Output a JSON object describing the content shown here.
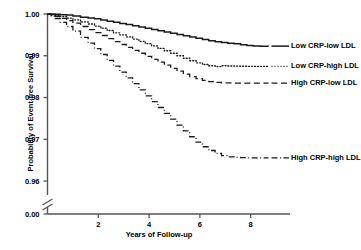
{
  "chart_data": {
    "type": "line",
    "title": "",
    "subtitle": "",
    "xlabel": "Years of Follow-up",
    "ylabel": "Probability of Event-free Survival",
    "xlim": [
      0,
      8.8
    ],
    "ylim": [
      0.96,
      1.0
    ],
    "y_axis_break": true,
    "y_break_label": "0.00",
    "grid": false,
    "legend_position": "right-inline",
    "xticks": [
      2,
      4,
      6,
      8
    ],
    "xtick_labels": [
      "2",
      "4",
      "6",
      "8"
    ],
    "yticks": [
      1.0,
      0.99,
      0.98,
      0.97,
      0.96
    ],
    "ytick_labels": [
      "1.00",
      "0.99",
      "0.98",
      "0.97",
      "0.96"
    ],
    "series": [
      {
        "name": "Low CRP-low LDL",
        "style": "solid",
        "label_x": 8.9,
        "label_y": 0.9923,
        "x": [
          0,
          0.15,
          0.3,
          0.5,
          0.75,
          1.0,
          1.3,
          1.6,
          1.85,
          2.1,
          2.35,
          2.6,
          2.85,
          3.1,
          3.35,
          3.6,
          3.85,
          4.1,
          4.35,
          4.6,
          4.85,
          5.1,
          5.35,
          5.6,
          5.85,
          6.1,
          6.35,
          6.6,
          6.85,
          7.1,
          7.35,
          7.6,
          7.85,
          8.1,
          8.4,
          8.7
        ],
        "y": [
          1.0,
          1.0,
          0.99995,
          0.99985,
          0.99975,
          0.99955,
          0.99925,
          0.99905,
          0.99885,
          0.99855,
          0.99825,
          0.998,
          0.99775,
          0.9975,
          0.9972,
          0.9969,
          0.9966,
          0.9963,
          0.996,
          0.9957,
          0.9954,
          0.9951,
          0.9948,
          0.9945,
          0.9942,
          0.9939,
          0.9936,
          0.99335,
          0.99315,
          0.993,
          0.99285,
          0.99265,
          0.99245,
          0.99235,
          0.9923,
          0.99228
        ]
      },
      {
        "name": "Low CRP-high LDL",
        "style": "dotted",
        "label_x": 8.9,
        "label_y": 0.98745,
        "x": [
          0,
          0.15,
          0.3,
          0.5,
          0.75,
          1.0,
          1.3,
          1.6,
          1.85,
          2.1,
          2.35,
          2.6,
          2.85,
          3.1,
          3.35,
          3.6,
          3.85,
          4.1,
          4.35,
          4.6,
          4.85,
          5.1,
          5.35,
          5.6,
          5.85,
          6.1,
          6.35,
          6.6,
          6.85,
          7.1,
          7.35,
          7.6,
          7.85,
          8.1,
          8.4,
          8.7
        ],
        "y": [
          1.0,
          0.99985,
          0.99965,
          0.99935,
          0.999,
          0.9986,
          0.9981,
          0.9976,
          0.9971,
          0.9966,
          0.99605,
          0.9955,
          0.995,
          0.9945,
          0.994,
          0.99345,
          0.9929,
          0.99235,
          0.99175,
          0.9912,
          0.9906,
          0.99,
          0.9894,
          0.9888,
          0.9883,
          0.9879,
          0.9876,
          0.9874,
          0.9876,
          0.98755,
          0.9875,
          0.98748,
          0.98746,
          0.98745,
          0.98745,
          0.98745
        ]
      },
      {
        "name": "High CRP-low LDL",
        "style": "dashed",
        "label_x": 8.9,
        "label_y": 0.98345,
        "x": [
          0,
          0.15,
          0.3,
          0.5,
          0.75,
          1.0,
          1.3,
          1.6,
          1.85,
          2.1,
          2.35,
          2.6,
          2.85,
          3.1,
          3.35,
          3.6,
          3.85,
          4.1,
          4.35,
          4.6,
          4.85,
          5.1,
          5.35,
          5.6,
          5.85,
          6.1,
          6.35,
          6.6,
          6.85,
          7.1,
          7.35,
          7.6,
          7.85,
          8.1,
          8.4,
          8.7
        ],
        "y": [
          1.0,
          0.99975,
          0.9994,
          0.99895,
          0.9984,
          0.9978,
          0.997,
          0.99625,
          0.99555,
          0.99485,
          0.9941,
          0.9934,
          0.9927,
          0.992,
          0.9913,
          0.9906,
          0.98985,
          0.98915,
          0.98845,
          0.98775,
          0.987,
          0.9863,
          0.9856,
          0.985,
          0.9845,
          0.9841,
          0.9838,
          0.9836,
          0.9835,
          0.98348,
          0.98346,
          0.98345,
          0.98345,
          0.98345,
          0.98345,
          0.98345
        ]
      },
      {
        "name": "High CRP-high LDL",
        "style": "dashdot",
        "label_x": 8.9,
        "label_y": 0.96555,
        "x": [
          0,
          0.15,
          0.3,
          0.5,
          0.75,
          1.0,
          1.3,
          1.6,
          1.85,
          2.1,
          2.35,
          2.6,
          2.85,
          3.1,
          3.35,
          3.6,
          3.85,
          4.1,
          4.35,
          4.6,
          4.85,
          5.1,
          5.35,
          5.6,
          5.85,
          6.1,
          6.35,
          6.6,
          6.85,
          7.1,
          7.35,
          7.6,
          7.85,
          8.1,
          8.4,
          8.7
        ],
        "y": [
          1.0,
          0.9995,
          0.9989,
          0.998,
          0.997,
          0.9959,
          0.9944,
          0.993,
          0.9917,
          0.9903,
          0.9889,
          0.9875,
          0.9861,
          0.9847,
          0.9833,
          0.98185,
          0.9804,
          0.979,
          0.9776,
          0.9762,
          0.9748,
          0.9734,
          0.972,
          0.9706,
          0.9693,
          0.9682,
          0.9673,
          0.9666,
          0.9661,
          0.9658,
          0.96565,
          0.96558,
          0.96555,
          0.96555,
          0.96555,
          0.96555
        ]
      }
    ],
    "colors": {
      "axis": "#555555",
      "line": "#1a1a1a",
      "text": "#000000"
    }
  }
}
